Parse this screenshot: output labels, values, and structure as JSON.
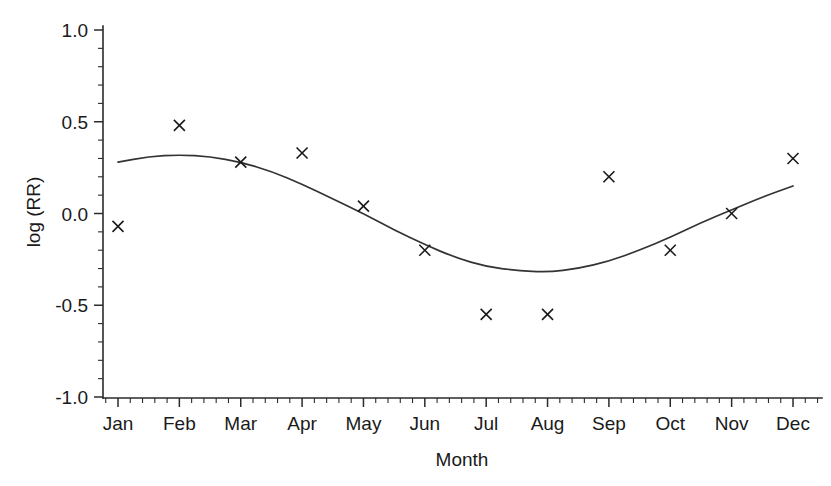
{
  "chart_data": {
    "type": "scatter",
    "title": "",
    "xlabel": "Month",
    "ylabel": "log (RR)",
    "categories": [
      "Jan",
      "Feb",
      "Mar",
      "Apr",
      "May",
      "Jun",
      "Jul",
      "Aug",
      "Sep",
      "Oct",
      "Nov",
      "Dec"
    ],
    "values": [
      -0.07,
      0.48,
      0.28,
      0.33,
      0.04,
      -0.2,
      -0.55,
      -0.55,
      0.2,
      -0.2,
      0.0,
      0.3
    ],
    "series": [
      {
        "name": "Observed log (RR)",
        "marker": "x",
        "values": [
          -0.07,
          0.48,
          0.28,
          0.33,
          0.04,
          -0.2,
          -0.55,
          -0.55,
          0.2,
          -0.2,
          0.0,
          0.3
        ]
      },
      {
        "name": "Fitted seasonal curve",
        "type": "line",
        "x": [
          1.0,
          1.5,
          2.0,
          2.5,
          3.0,
          3.5,
          4.0,
          4.5,
          5.0,
          5.5,
          6.0,
          6.5,
          7.0,
          7.5,
          8.0,
          8.5,
          9.0,
          9.5,
          10.0,
          10.5,
          11.0,
          11.5,
          12.0
        ],
        "values": [
          0.28,
          0.31,
          0.32,
          0.31,
          0.28,
          0.23,
          0.16,
          0.08,
          0.0,
          -0.09,
          -0.17,
          -0.24,
          -0.29,
          -0.31,
          -0.32,
          -0.3,
          -0.26,
          -0.2,
          -0.13,
          -0.05,
          0.02,
          0.09,
          0.15
        ]
      }
    ],
    "ylim": [
      -1.0,
      1.0
    ],
    "yticks": [
      "1.0",
      "0.5",
      "0.0",
      "-0.5",
      "-1.0"
    ],
    "ytick_values": [
      1.0,
      0.5,
      0.0,
      -0.5,
      -1.0
    ],
    "y_minor_step": 0.1,
    "x_minor_per_interval": 4,
    "grid": false,
    "legend": "none",
    "axis_style": "left-and-bottom-spines"
  },
  "axes": {
    "y_axis_title": "log (RR)",
    "x_axis_title": "Month"
  }
}
